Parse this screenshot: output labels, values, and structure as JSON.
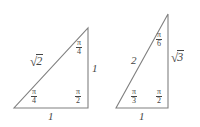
{
  "figure": {
    "background_color": "#ffffff",
    "stroke_color": "#808080",
    "text_color": "#454545",
    "triangles": [
      {
        "name": "isosceles-right-triangle",
        "angle_set": "45-45-90",
        "vertices": {
          "bottom_left": [
            14,
            108
          ],
          "bottom_right": [
            88,
            108
          ],
          "apex": [
            88,
            28
          ]
        },
        "sides": {
          "hypotenuse_label": "2",
          "hypotenuse_prefix": "√",
          "vertical_leg_label": "1",
          "base_label": "1"
        },
        "angles": {
          "apex": {
            "numerator": "π",
            "denominator": "4"
          },
          "bottom_left": {
            "numerator": "π",
            "denominator": "4"
          },
          "bottom_right": {
            "numerator": "π",
            "denominator": "2"
          }
        }
      },
      {
        "name": "thirty-sixty-ninety-triangle",
        "angle_set": "30-60-90",
        "vertices": {
          "bottom_left": [
            116,
            108
          ],
          "bottom_right": [
            168,
            108
          ],
          "apex": [
            168,
            14
          ]
        },
        "sides": {
          "hypotenuse_label": "2",
          "vertical_leg_label": "3",
          "vertical_leg_prefix": "√",
          "base_label": "1"
        },
        "angles": {
          "apex": {
            "numerator": "π",
            "denominator": "6"
          },
          "bottom_left": {
            "numerator": "π",
            "denominator": "3"
          },
          "bottom_right": {
            "numerator": "π",
            "denominator": "2"
          }
        }
      }
    ]
  }
}
